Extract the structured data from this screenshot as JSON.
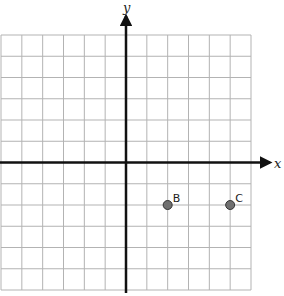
{
  "diagram": {
    "type": "coordinate-plane",
    "grid": {
      "columns": 12,
      "rows": 12,
      "x_min": -6,
      "x_max": 6,
      "y_min": -6,
      "y_max": 6,
      "line_color": "#b3b3b3"
    },
    "axes": {
      "x_label": "x",
      "y_label": "y",
      "color": "#111111"
    },
    "points": [
      {
        "label": "B",
        "x": 2,
        "y": -2
      },
      {
        "label": "C",
        "x": 5,
        "y": -2
      }
    ],
    "point_style": {
      "fill": "#707070",
      "stroke": "#333333"
    }
  }
}
